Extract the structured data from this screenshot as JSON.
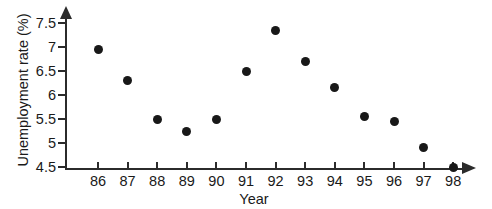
{
  "chart_data": {
    "type": "scatter",
    "title": "",
    "xlabel": "Year",
    "ylabel": "Unemployment rate (%)",
    "categories": [
      "86",
      "87",
      "88",
      "89",
      "90",
      "91",
      "92",
      "93",
      "94",
      "95",
      "96",
      "97",
      "98"
    ],
    "x": [
      1986,
      1987,
      1988,
      1989,
      1990,
      1991,
      1992,
      1993,
      1994,
      1995,
      1996,
      1997,
      1998
    ],
    "values": [
      6.95,
      6.3,
      5.5,
      5.25,
      5.5,
      6.5,
      7.35,
      6.7,
      6.15,
      5.55,
      5.45,
      4.9,
      4.5
    ],
    "xtick_labels": [
      "86",
      "87",
      "88",
      "89",
      "90",
      "91",
      "92",
      "93",
      "94",
      "95",
      "96",
      "97",
      "98"
    ],
    "ytick_labels": [
      "7.5",
      "7",
      "6.5",
      "6",
      "5.5",
      "5",
      "4.5"
    ],
    "ytick_values": [
      7.5,
      7,
      6.5,
      6,
      5.5,
      5,
      4.5
    ],
    "ylim": [
      4.5,
      7.5
    ],
    "xlim": [
      1985.5,
      1998.5
    ],
    "grid": false,
    "legend": null,
    "marker_color": "#181818",
    "axis_color": "#2b2b2b"
  }
}
